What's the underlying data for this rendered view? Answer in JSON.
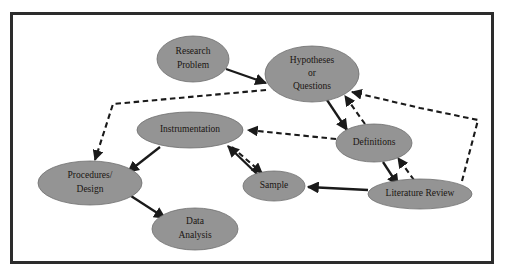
{
  "figure": {
    "frame": {
      "border_color": "#2c2c2c",
      "background_color": "#ffffff"
    },
    "node_style": {
      "fill_color": "#949494",
      "stroke_color": "#6f6f6f",
      "text_color": "#1a1512"
    },
    "edge_style": {
      "solid_color": "#1a1a1a",
      "dashed_color": "#1a1a1a"
    }
  },
  "nodes": [
    {
      "id": "research-problem",
      "label": "Research Problem",
      "lines": [
        "Research",
        "Problem"
      ],
      "cx": 193,
      "cy": 59,
      "rx": 36,
      "ry": 23,
      "font_size": 9.5
    },
    {
      "id": "hypotheses-or-questions",
      "label": "Hypotheses or Questions",
      "lines": [
        "Hypotheses",
        "or",
        "Questions"
      ],
      "cx": 312,
      "cy": 74,
      "rx": 47,
      "ry": 28,
      "font_size": 9.5
    },
    {
      "id": "instrumentation",
      "label": "Instrumentation",
      "lines": [
        "Instrumentation"
      ],
      "cx": 190,
      "cy": 130,
      "rx": 53,
      "ry": 18,
      "font_size": 9.5
    },
    {
      "id": "definitions",
      "label": "Definitions",
      "lines": [
        "Definitions"
      ],
      "cx": 374,
      "cy": 143,
      "rx": 38,
      "ry": 19,
      "font_size": 9.5
    },
    {
      "id": "procedures-design",
      "label": "Procedures/ Design",
      "lines": [
        "Procedures/",
        "Design"
      ],
      "cx": 90,
      "cy": 183,
      "rx": 52,
      "ry": 22,
      "font_size": 9.5
    },
    {
      "id": "sample",
      "label": "Sample",
      "lines": [
        "Sample"
      ],
      "cx": 274,
      "cy": 186,
      "rx": 31,
      "ry": 15,
      "font_size": 9.5
    },
    {
      "id": "literature-review",
      "label": "Literature Review",
      "lines": [
        "Literature Review"
      ],
      "cx": 420,
      "cy": 194,
      "rx": 52,
      "ry": 15,
      "font_size": 9.5
    },
    {
      "id": "data-analysis",
      "label": "Data Analysis",
      "lines": [
        "Data",
        "Analysis"
      ],
      "cx": 195,
      "cy": 229,
      "rx": 43,
      "ry": 21,
      "font_size": 9.5
    }
  ],
  "edges": [
    {
      "id": "research-problem-to-hypotheses",
      "from": "research-problem",
      "to": "hypotheses-or-questions",
      "style": "solid",
      "points": "226,69 266,83"
    },
    {
      "id": "hypotheses-to-definitions",
      "from": "hypotheses-or-questions",
      "to": "definitions",
      "style": "solid",
      "points": "327,100 347,130"
    },
    {
      "id": "definitions-to-hypotheses",
      "from": "definitions",
      "to": "hypotheses-or-questions",
      "style": "dashed",
      "points": "365,124 345,96"
    },
    {
      "id": "definitions-to-literature-review",
      "from": "definitions",
      "to": "literature-review",
      "style": "solid",
      "points": "383,162 398,185"
    },
    {
      "id": "literature-review-to-definitions",
      "from": "literature-review",
      "to": "definitions",
      "style": "dashed",
      "points": "414,180 398,158"
    },
    {
      "id": "literature-review-to-hypotheses",
      "from": "literature-review",
      "to": "hypotheses-or-questions",
      "style": "dashed",
      "points": "462,181 478,120 420,108 352,92"
    },
    {
      "id": "literature-review-to-sample",
      "from": "literature-review",
      "to": "sample",
      "style": "solid",
      "points": "368,190 308,187"
    },
    {
      "id": "definitions-to-instrumentation",
      "from": "definitions",
      "to": "instrumentation",
      "style": "dashed",
      "points": "336,139 248,130"
    },
    {
      "id": "hypotheses-to-procedures",
      "from": "hypotheses-or-questions",
      "to": "procedures-design",
      "style": "dashed",
      "points": "266,90 113,104 95,160"
    },
    {
      "id": "instrumentation-to-procedures",
      "from": "instrumentation",
      "to": "procedures-design",
      "style": "solid",
      "points": "160,147 128,172"
    },
    {
      "id": "instrumentation-to-sample",
      "from": "instrumentation",
      "to": "sample",
      "style": "dashed",
      "points": "232,147 262,173"
    },
    {
      "id": "sample-to-instrumentation",
      "from": "sample",
      "to": "instrumentation",
      "style": "solid",
      "points": "257,174 228,146"
    },
    {
      "id": "procedures-to-data-analysis",
      "from": "procedures-design",
      "to": "data-analysis",
      "style": "solid",
      "points": "131,196 165,218"
    }
  ]
}
